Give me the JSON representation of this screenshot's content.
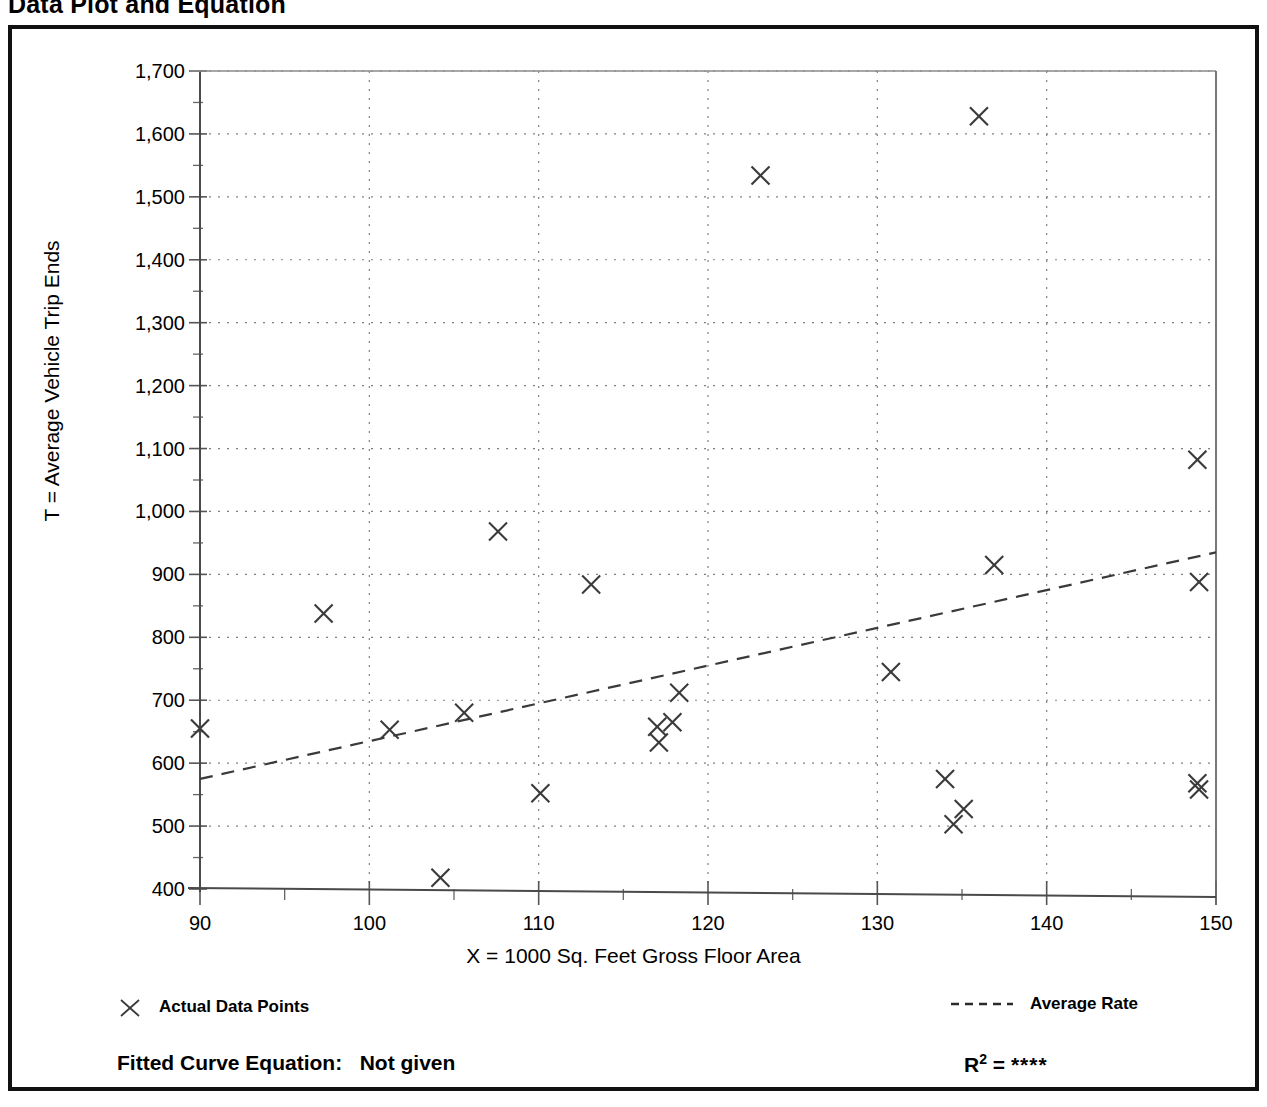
{
  "page": {
    "title": "Data Plot and Equation"
  },
  "footer": {
    "equation_label": "Fitted Curve Equation:",
    "equation_value": "Not given",
    "r2_label": "R",
    "r2_exponent": "2",
    "r2_equals": "=",
    "r2_value": "****"
  },
  "legend": {
    "items": [
      {
        "label": "Actual Data Points",
        "marker": "x-marker-icon",
        "color": "#3a3a3a"
      },
      {
        "label": "Average Rate",
        "marker": "dashed-line-icon",
        "color": "#3a3a3a"
      }
    ]
  },
  "chart_data": {
    "type": "scatter",
    "title": "Data Plot and Equation",
    "xlabel": "X = 1000 Sq. Feet Gross Floor Area",
    "ylabel": "T = Average Vehicle Trip Ends",
    "xlim": [
      90,
      150
    ],
    "ylim": [
      400,
      1700
    ],
    "xticks": [
      90,
      100,
      110,
      120,
      130,
      140,
      150
    ],
    "xtick_labels": [
      "90",
      "100",
      "110",
      "120",
      "130",
      "140",
      "150"
    ],
    "yticks": [
      400,
      500,
      600,
      700,
      800,
      900,
      1000,
      1100,
      1200,
      1300,
      1400,
      1500,
      1600,
      1700
    ],
    "ytick_labels": [
      "400",
      "500",
      "600",
      "700",
      "800",
      "900",
      "1,000",
      "1,100",
      "1,200",
      "1,300",
      "1,400",
      "1,500",
      "1,600",
      "1,700"
    ],
    "x_minor_tick_step": 5,
    "y_minor_tick_step": 50,
    "grid": true,
    "grid_style": "dotted",
    "legend_position": "below-plot",
    "series": [
      {
        "name": "Actual Data Points",
        "marker": "x",
        "color": "#3a3a3a",
        "points": [
          {
            "x": 90.0,
            "y": 655
          },
          {
            "x": 97.3,
            "y": 838
          },
          {
            "x": 101.2,
            "y": 653
          },
          {
            "x": 104.2,
            "y": 418
          },
          {
            "x": 105.6,
            "y": 680
          },
          {
            "x": 107.6,
            "y": 968
          },
          {
            "x": 110.1,
            "y": 552
          },
          {
            "x": 113.1,
            "y": 884
          },
          {
            "x": 117.0,
            "y": 658
          },
          {
            "x": 117.1,
            "y": 633
          },
          {
            "x": 117.9,
            "y": 665
          },
          {
            "x": 118.3,
            "y": 712
          },
          {
            "x": 123.1,
            "y": 1534
          },
          {
            "x": 130.8,
            "y": 745
          },
          {
            "x": 134.0,
            "y": 575
          },
          {
            "x": 134.5,
            "y": 503
          },
          {
            "x": 135.1,
            "y": 527
          },
          {
            "x": 136.0,
            "y": 1628
          },
          {
            "x": 136.9,
            "y": 915
          },
          {
            "x": 148.9,
            "y": 1082
          },
          {
            "x": 149.0,
            "y": 888
          },
          {
            "x": 148.9,
            "y": 568
          },
          {
            "x": 149.0,
            "y": 558
          }
        ]
      },
      {
        "name": "Average Rate",
        "marker": "none",
        "linestyle": "dashed",
        "color": "#3a3a3a",
        "x": [
          90,
          150
        ],
        "values": [
          575,
          935
        ]
      }
    ]
  }
}
